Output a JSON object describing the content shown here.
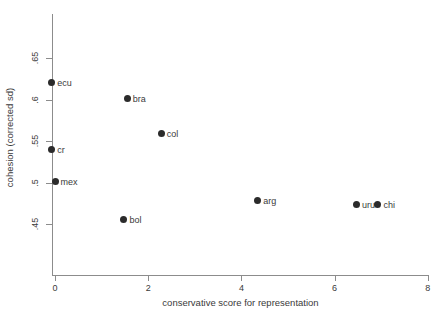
{
  "chart_data": {
    "type": "scatter",
    "title": "",
    "xlabel": "conservative score for representation",
    "ylabel": "cohesion (corrected sd)",
    "xlim": [
      -0.3,
      8.05
    ],
    "ylim": [
      0.425,
      0.675
    ],
    "xticks": [
      0,
      2,
      4,
      6,
      8
    ],
    "xtick_labels": [
      "0",
      "2",
      "4",
      "6",
      "8"
    ],
    "yticks": [
      0.65,
      0.6,
      0.55,
      0.5,
      0.45
    ],
    "ytick_labels": [
      ".65",
      ".6",
      ".55",
      ".5",
      ".45"
    ],
    "grid": false,
    "legend": "none",
    "marker_color": "#2b2b2b",
    "axis_color": "#8c8c8c",
    "points": [
      {
        "label": "ecu",
        "x": -0.07,
        "y": 0.621
      },
      {
        "label": "bra",
        "x": 1.55,
        "y": 0.601
      },
      {
        "label": "col",
        "x": 2.28,
        "y": 0.559
      },
      {
        "label": "cr",
        "x": -0.07,
        "y": 0.54
      },
      {
        "label": "mex",
        "x": 0.0,
        "y": 0.501
      },
      {
        "label": "bol",
        "x": 1.48,
        "y": 0.456
      },
      {
        "label": "arg",
        "x": 4.35,
        "y": 0.478
      },
      {
        "label": "uru",
        "x": 6.47,
        "y": 0.473
      },
      {
        "label": "chi",
        "x": 6.93,
        "y": 0.473
      }
    ]
  }
}
